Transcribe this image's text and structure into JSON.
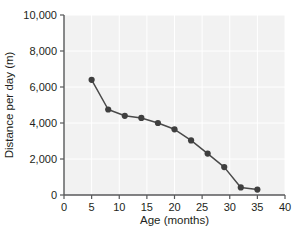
{
  "chart_data": {
    "type": "line",
    "title": "",
    "xlabel": "Age (months)",
    "ylabel": "Distance per day (m)",
    "xlim": [
      0,
      40
    ],
    "ylim": [
      0,
      10000
    ],
    "xticks": [
      "0",
      "5",
      "10",
      "15",
      "20",
      "25",
      "30",
      "35",
      "40"
    ],
    "xtick_values": [
      0,
      5,
      10,
      15,
      20,
      25,
      30,
      35,
      40
    ],
    "yticks": [
      "0",
      "2,000",
      "4,000",
      "6,000",
      "8,000",
      "10,000"
    ],
    "ytick_values": [
      0,
      2000,
      4000,
      6000,
      8000,
      10000
    ],
    "grid": true,
    "legend": "none",
    "x": [
      5,
      8,
      11,
      14,
      17,
      20,
      23,
      26,
      29,
      32,
      35
    ],
    "values": [
      6400,
      4750,
      4400,
      4280,
      4000,
      3650,
      3030,
      2300,
      1550,
      420,
      300
    ],
    "series": [
      {
        "name": "Distance per day",
        "x": [
          5,
          8,
          11,
          14,
          17,
          20,
          23,
          26,
          29,
          32,
          35
        ],
        "values": [
          6400,
          4750,
          4400,
          4280,
          4000,
          3650,
          3030,
          2300,
          1550,
          420,
          300
        ],
        "marker": "circle",
        "color": "#4a4a4a"
      }
    ],
    "colors": {
      "plot_background": "#f2f2f2",
      "grid": "#ffffff",
      "axis": "#58595b",
      "line": "#555555",
      "marker": "#3f3f3f",
      "text": "#231f20",
      "figure_background": "#ffffff"
    }
  }
}
